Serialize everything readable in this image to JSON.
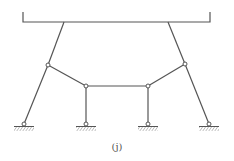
{
  "figure": {
    "label": "(j)",
    "colors": {
      "line": "#555555",
      "hinge_fill": "#ffffff",
      "hatch": "#777777"
    },
    "beam": {
      "x1": 23,
      "x2": 210,
      "y": 22,
      "tick_top": 12
    },
    "nodes": {
      "top_left": [
        64,
        22
      ],
      "top_right": [
        168,
        22
      ],
      "hinge_left": [
        48,
        65
      ],
      "hinge_right": [
        185,
        64
      ],
      "hinge_mid_left": [
        86,
        86
      ],
      "hinge_mid_right": [
        148,
        86
      ],
      "support_1": [
        24,
        124
      ],
      "support_2": [
        86,
        124
      ],
      "support_3": [
        148,
        124
      ],
      "support_4": [
        209,
        124
      ]
    },
    "supports": [
      "pin",
      "pin",
      "pin",
      "pin"
    ]
  }
}
